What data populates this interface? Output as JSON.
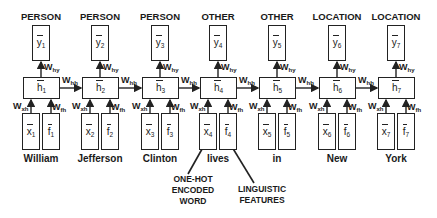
{
  "diagram": {
    "type": "unrolled-rnn-ner",
    "timesteps": [
      {
        "index": "1",
        "label": "PERSON",
        "output": "y",
        "hidden": "h",
        "input": "x",
        "feature": "f",
        "word": "William"
      },
      {
        "index": "2",
        "label": "PERSON",
        "output": "y",
        "hidden": "h",
        "input": "x",
        "feature": "f",
        "word": "Jefferson"
      },
      {
        "index": "3",
        "label": "PERSON",
        "output": "y",
        "hidden": "h",
        "input": "x",
        "feature": "f",
        "word": "Clinton"
      },
      {
        "index": "4",
        "label": "OTHER",
        "output": "y",
        "hidden": "h",
        "input": "x",
        "feature": "f",
        "word": "lives"
      },
      {
        "index": "5",
        "label": "OTHER",
        "output": "y",
        "hidden": "h",
        "input": "x",
        "feature": "f",
        "word": "in"
      },
      {
        "index": "6",
        "label": "LOCATION",
        "output": "y",
        "hidden": "h",
        "input": "x",
        "feature": "f",
        "word": "New"
      },
      {
        "index": "7",
        "label": "LOCATION",
        "output": "y",
        "hidden": "h",
        "input": "x",
        "feature": "f",
        "word": "York"
      }
    ],
    "weights": {
      "hy": {
        "base": "W",
        "sub": "hy"
      },
      "hh": {
        "base": "W",
        "sub": "hh"
      },
      "xh": {
        "base": "W",
        "sub": "xh"
      },
      "fh": {
        "base": "W",
        "sub": "fh"
      }
    },
    "annotations": {
      "one_hot": {
        "lines": [
          "ONE-HOT",
          "ENCODED",
          "WORD"
        ]
      },
      "linguistic": {
        "lines": [
          "LINGUISTIC",
          "FEATURES"
        ]
      }
    }
  }
}
